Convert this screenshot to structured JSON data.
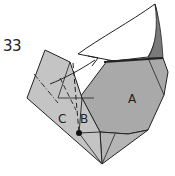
{
  "diagram": {
    "step_number": "33",
    "labels": {
      "a": "A",
      "b": "B",
      "c": "C"
    },
    "colors": {
      "paper_light": "#c4c4c4",
      "paper_mid": "#a9a9a9",
      "paper_dark": "#7a7a7a",
      "line": "#222222",
      "background": "#ffffff"
    },
    "annotations": [
      "valley-fold-dashed-line",
      "mountain-fold-dash-dot-line",
      "fold-arrow",
      "reference-point-dot"
    ]
  }
}
